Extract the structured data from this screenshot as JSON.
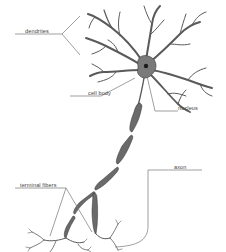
{
  "diagram": {
    "labels": {
      "dendrites": "dendrites",
      "cell_body": "cell body",
      "nucleus": "nucleus",
      "axon": "axon",
      "terminal_fibers": "terminal fibers"
    },
    "colors": {
      "background": "#ffffff",
      "neuron_fill": "#8a8a8a",
      "neuron_outline": "#3a3a3a",
      "leader_line": "#777777",
      "label_text": "#444444"
    }
  }
}
